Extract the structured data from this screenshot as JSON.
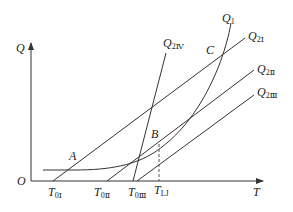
{
  "axes": {
    "y_label": "Q",
    "x_label": "T",
    "origin_label": "O"
  },
  "x_ticks": [
    {
      "main": "T",
      "sub": "0Ⅰ"
    },
    {
      "main": "T",
      "sub": "0Ⅱ"
    },
    {
      "main": "T",
      "sub": "0Ⅲ"
    },
    {
      "main": "T",
      "sub": "LJ"
    }
  ],
  "curves": {
    "q1": {
      "main": "Q",
      "sub": "1"
    },
    "q2_1": {
      "main": "Q",
      "sub": "2Ⅰ"
    },
    "q2_2": {
      "main": "Q",
      "sub": "2Ⅱ"
    },
    "q2_3": {
      "main": "Q",
      "sub": "2Ⅲ"
    },
    "q2_4": {
      "main": "Q",
      "sub": "2Ⅳ"
    }
  },
  "points": {
    "a": "A",
    "b": "B",
    "c": "C"
  },
  "colors": {
    "line": "#333333",
    "text": "#222222",
    "background": "#ffffff"
  }
}
